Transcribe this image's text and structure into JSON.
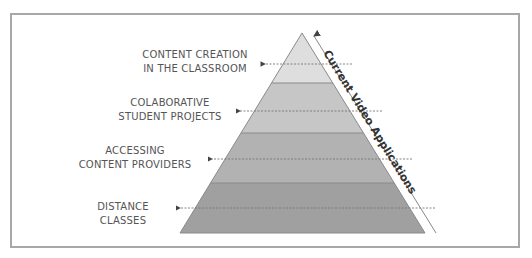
{
  "diagram": {
    "title": "Current Video Applications",
    "type": "pyramid",
    "levels": [
      {
        "line1": "CONTENT CREATION",
        "line2": "IN THE CLASSROOM",
        "fill": "#dedede"
      },
      {
        "line1": "COLABORATIVE",
        "line2": "STUDENT PROJECTS",
        "fill": "#c6c6c6"
      },
      {
        "line1": "ACCESSING",
        "line2": "CONTENT PROVIDERS",
        "fill": "#b2b2b2"
      },
      {
        "line1": "DISTANCE",
        "line2": "CLASSES",
        "fill": "#a0a0a0"
      }
    ],
    "colors": {
      "frame": "#a8a8a8",
      "band_separator": "#8a8a8a",
      "dashed_line": "#777777",
      "text": "#555555",
      "axis_text": "#333333"
    }
  }
}
